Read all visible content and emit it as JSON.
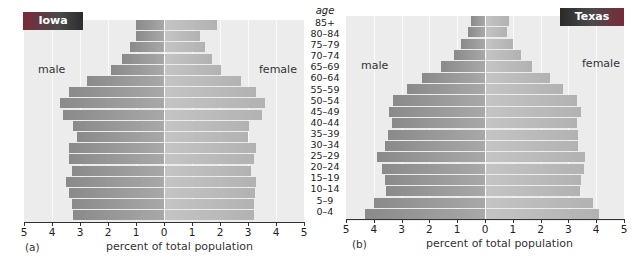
{
  "chart_data": [
    {
      "type": "bar",
      "subtype": "population_pyramid",
      "title": "Iowa",
      "panel_tag": "(a)",
      "xlabel": "percent of total population",
      "ylabel": "age",
      "xlim": [
        -5,
        5
      ],
      "xticks": [
        "5",
        "4",
        "3",
        "2",
        "1",
        "0",
        "1",
        "2",
        "3",
        "4",
        "5"
      ],
      "grid": true,
      "side_labels": {
        "left": "male",
        "right": "female"
      },
      "categories": [
        "85+",
        "80–84",
        "75–79",
        "70–74",
        "65–69",
        "60–64",
        "55–59",
        "50–54",
        "45–49",
        "40–44",
        "35–39",
        "30–34",
        "25–29",
        "20–24",
        "15–19",
        "10–14",
        "5–9",
        "0–4"
      ],
      "series": [
        {
          "name": "male",
          "values": [
            1.0,
            1.0,
            1.2,
            1.5,
            1.9,
            2.75,
            3.4,
            3.7,
            3.6,
            3.25,
            3.1,
            3.4,
            3.4,
            3.3,
            3.5,
            3.4,
            3.3,
            3.25
          ]
        },
        {
          "name": "female",
          "values": [
            1.9,
            1.3,
            1.45,
            1.7,
            2.05,
            2.75,
            3.3,
            3.6,
            3.5,
            3.05,
            3.0,
            3.3,
            3.2,
            3.1,
            3.3,
            3.25,
            3.2,
            3.2
          ]
        }
      ]
    },
    {
      "type": "bar",
      "subtype": "population_pyramid",
      "title": "Texas",
      "panel_tag": "(b)",
      "xlabel": "percent of total population",
      "ylabel": "age",
      "xlim": [
        -5,
        5
      ],
      "xticks": [
        "5",
        "4",
        "3",
        "2",
        "1",
        "0",
        "1",
        "2",
        "3",
        "4",
        "5"
      ],
      "grid": true,
      "side_labels": {
        "left": "male",
        "right": "female"
      },
      "categories": [
        "85+",
        "80–84",
        "75–79",
        "70–74",
        "65–69",
        "60–64",
        "55–59",
        "50–54",
        "45–49",
        "40–44",
        "35–39",
        "30–34",
        "25–29",
        "20–24",
        "15–19",
        "10–14",
        "5–9",
        "0–4"
      ],
      "series": [
        {
          "name": "male",
          "values": [
            0.5,
            0.6,
            0.85,
            1.1,
            1.6,
            2.25,
            2.8,
            3.3,
            3.45,
            3.35,
            3.5,
            3.6,
            3.9,
            3.7,
            3.6,
            3.55,
            4.0,
            4.3
          ]
        },
        {
          "name": "female",
          "values": [
            0.85,
            0.8,
            1.0,
            1.3,
            1.7,
            2.35,
            2.8,
            3.3,
            3.45,
            3.3,
            3.35,
            3.35,
            3.6,
            3.55,
            3.45,
            3.4,
            3.9,
            4.1
          ]
        }
      ]
    }
  ],
  "labels": {
    "age_header": "age",
    "iowa": {
      "title": "Iowa",
      "male": "male",
      "female": "female",
      "tag": "(a)",
      "xlabel": "percent of total population"
    },
    "texas": {
      "title": "Texas",
      "male": "male",
      "female": "female",
      "tag": "(b)",
      "xlabel": "percent of total population"
    }
  },
  "colors": {
    "male_bar": "#999999",
    "female_bar": "#bcbcbc",
    "plot_bg": "#ececec",
    "title_box": "#3a3a3a"
  }
}
